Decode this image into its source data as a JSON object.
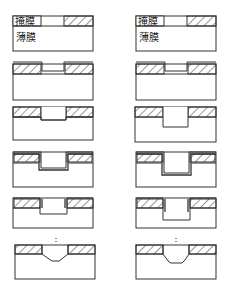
{
  "labels": {
    "mask": "掩膜",
    "film": "薄膜",
    "continuation": "⋮"
  },
  "columns": [
    {
      "name": "left",
      "description": "shallow trench sequence",
      "steps": 6
    },
    {
      "name": "right",
      "description": "deep trench sequence",
      "steps": 6
    }
  ],
  "steps": [
    {
      "index": 1,
      "description": "mask patterned on thin film"
    },
    {
      "index": 2,
      "description": "thin layer deposited over mask and opening"
    },
    {
      "index": 3,
      "description": "film etched through opening"
    },
    {
      "index": 4,
      "description": "conformal liner deposited in trench"
    },
    {
      "index": 5,
      "description": "further etch with sidewall liners"
    },
    {
      "index": 6,
      "description": "final tapered trench profile"
    }
  ],
  "colors": {
    "stroke": "#333333",
    "hatch": "#444444",
    "background": "#ffffff"
  }
}
